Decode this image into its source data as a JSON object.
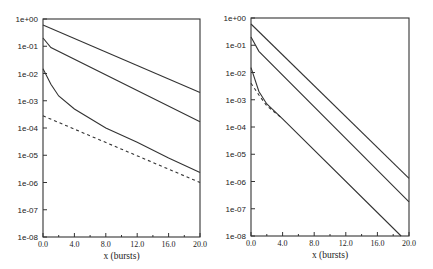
{
  "chart_data": [
    {
      "type": "line",
      "title": "",
      "xlabel": "x (bursts)",
      "ylabel": "",
      "yscale": "log",
      "xlim": [
        0,
        20
      ],
      "ylim": [
        1e-08,
        1
      ],
      "grid": false,
      "legend": null,
      "x_ticks": [
        "0.0",
        "4.0",
        "8.0",
        "12.0",
        "16.0",
        "20.0"
      ],
      "y_ticks": [
        "1e+00",
        "1e-01",
        "1e-02",
        "1e-03",
        "1e-04",
        "1e-05",
        "1e-06",
        "1e-07",
        "1e-08"
      ],
      "series": [
        {
          "name": "curve-1",
          "style": "solid",
          "x": [
            0,
            20
          ],
          "y": [
            0.6,
            0.002
          ]
        },
        {
          "name": "curve-2",
          "style": "solid",
          "x": [
            0,
            1,
            20
          ],
          "y": [
            0.2,
            0.09,
            0.00017
          ]
        },
        {
          "name": "curve-3",
          "style": "solid",
          "x": [
            0,
            1,
            2,
            4,
            8,
            12,
            16,
            20
          ],
          "y": [
            0.015,
            0.004,
            0.0015,
            0.0005,
            0.0001,
            3e-05,
            8e-06,
            2.3e-06
          ]
        },
        {
          "name": "curve-dashed",
          "style": "dashed",
          "x": [
            0,
            20
          ],
          "y": [
            0.00028,
            1e-06
          ]
        }
      ]
    },
    {
      "type": "line",
      "title": "",
      "xlabel": "x (bursts)",
      "ylabel": "",
      "yscale": "log",
      "xlim": [
        0,
        20
      ],
      "ylim": [
        1e-08,
        1
      ],
      "grid": false,
      "legend": null,
      "x_ticks": [
        "0.0",
        "4.0",
        "8.0",
        "12.0",
        "16.0",
        "20.0"
      ],
      "y_ticks": [
        "1e+00",
        "1e-01",
        "1e-02",
        "1e-03",
        "1e-04",
        "1e-05",
        "1e-06",
        "1e-07",
        "1e-08"
      ],
      "series": [
        {
          "name": "curve-1",
          "style": "solid",
          "x": [
            0,
            20
          ],
          "y": [
            0.6,
            1.3e-06
          ]
        },
        {
          "name": "curve-2",
          "style": "solid",
          "x": [
            0,
            1,
            20
          ],
          "y": [
            0.2,
            0.06,
            1.8e-07
          ]
        },
        {
          "name": "curve-3",
          "style": "solid",
          "x": [
            0,
            1,
            2,
            4,
            19
          ],
          "y": [
            0.015,
            0.002,
            0.0007,
            0.0002,
            1e-08
          ]
        },
        {
          "name": "curve-dashed",
          "style": "dashed",
          "x": [
            0,
            1,
            2,
            4
          ],
          "y": [
            0.004,
            0.0015,
            0.0006,
            0.0002
          ]
        }
      ]
    }
  ]
}
